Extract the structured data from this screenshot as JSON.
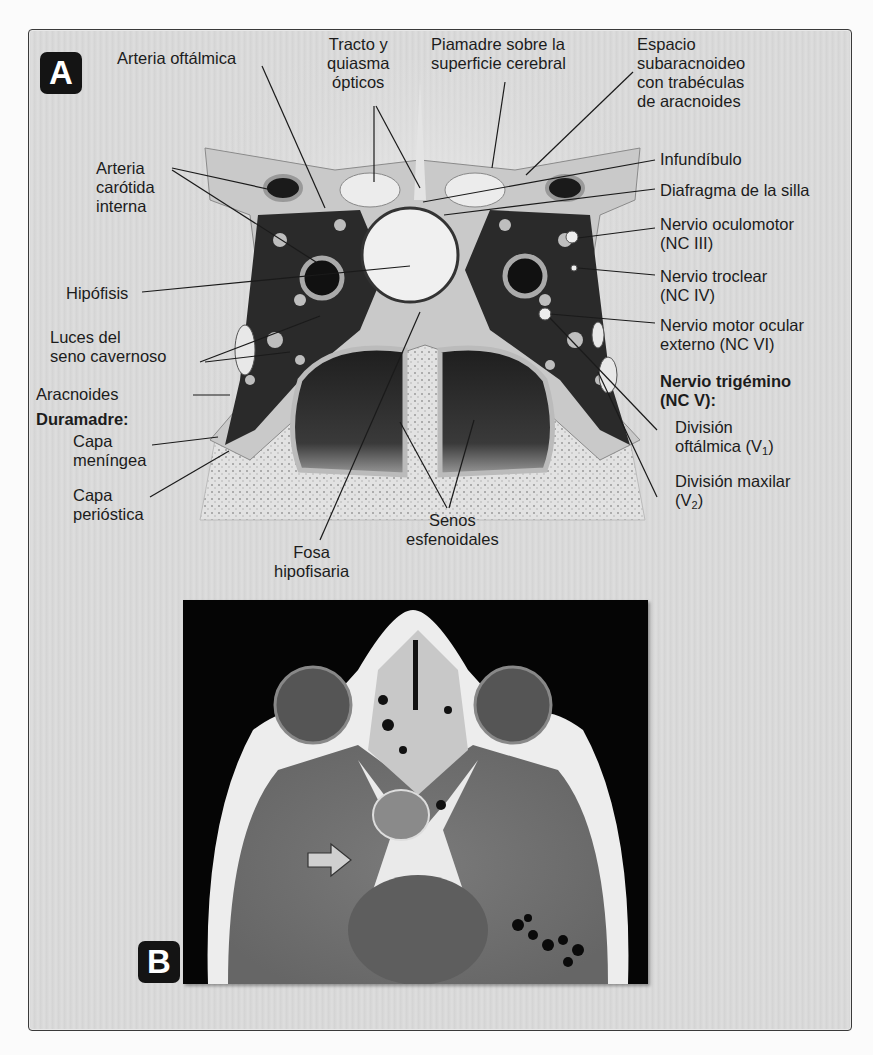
{
  "figure": {
    "panels": [
      {
        "id": "A",
        "badge": "A",
        "type": "coronal illustration of cavernous sinus"
      },
      {
        "id": "B",
        "badge": "B",
        "type": "axial CT image",
        "arrow": "white arrow pointing right"
      }
    ],
    "labels": {
      "arteria_oftalmica": "Arteria oftálmica",
      "tracto_quiasma": "Tracto y\nquiasma\nópticos",
      "piamadre": "Piamadre sobre la\nsuperficie cerebral",
      "espacio_subaracnoideo": "Espacio\nsubaracnoideo\ncon trabéculas\nde aracnoides",
      "arteria_carotida": "Arteria\ncarótida\ninterna",
      "infundibulo": "Infundíbulo",
      "diafragma": "Diafragma de la silla",
      "nervio_oculomotor": "Nervio oculomotor\n(NC III)",
      "hipofisis": "Hipófisis",
      "nervio_troclear": "Nervio troclear\n(NC IV)",
      "nervio_motor_ocular": "Nervio motor ocular\nexterno (NC VI)",
      "luces_seno": "Luces del\nseno cavernoso",
      "aracnoides": "Aracnoides",
      "duramadre": "Duramadre:",
      "capa_meningea": "Capa\nmeníngea",
      "capa_periostica": "Capa\nperióstica",
      "nervio_trigemino": "Nervio trigémino\n(NC V):",
      "division_oftalmica": "División\noftálmica (V",
      "division_oftalmica_sub": "1",
      "division_oftalmica_end": ")",
      "division_maxilar": "División maxilar\n(V",
      "division_maxilar_sub": "2",
      "division_maxilar_end": ")",
      "fosa_hipofisaria": "Fosa\nhipofisaria",
      "senos_esfenoidales": "Senos\nesfenoidales"
    }
  }
}
